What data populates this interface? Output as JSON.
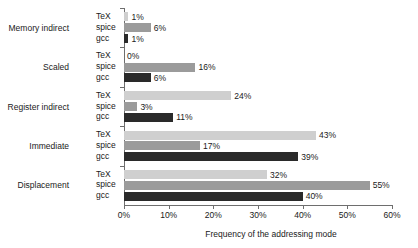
{
  "chart_data": {
    "type": "bar",
    "orientation": "horizontal",
    "title": "",
    "xlabel": "Frequency of the addressing mode",
    "ylabel": "",
    "xlim": [
      0,
      60
    ],
    "x_tick_labels": [
      "0%",
      "10%",
      "20%",
      "30%",
      "40%",
      "50%",
      "60%"
    ],
    "x_ticks": [
      0,
      10,
      20,
      30,
      40,
      50,
      60
    ],
    "grid": false,
    "legend": "none",
    "categories": [
      "Memory indirect",
      "Scaled",
      "Register indirect",
      "Immediate",
      "Displacement"
    ],
    "series": [
      {
        "name": "TeX",
        "color": "#cfcfcf",
        "values": [
          1,
          0,
          24,
          43,
          32
        ],
        "value_labels": [
          "1%",
          "0%",
          "24%",
          "43%",
          "32%"
        ]
      },
      {
        "name": "spice",
        "color": "#9b9b9b",
        "values": [
          6,
          16,
          3,
          17,
          55
        ],
        "value_labels": [
          "6%",
          "16%",
          "3%",
          "17%",
          "55%"
        ]
      },
      {
        "name": "gcc",
        "color": "#2a2a2a",
        "values": [
          1,
          6,
          11,
          39,
          40
        ],
        "value_labels": [
          "1%",
          "6%",
          "11%",
          "39%",
          "40%"
        ]
      }
    ]
  },
  "colors": {
    "tex": "#cfcfcf",
    "spice": "#9b9b9b",
    "gcc": "#2a2a2a",
    "axis": "#6e6e6e",
    "text": "#1a1a1a",
    "background": "#ffffff"
  }
}
